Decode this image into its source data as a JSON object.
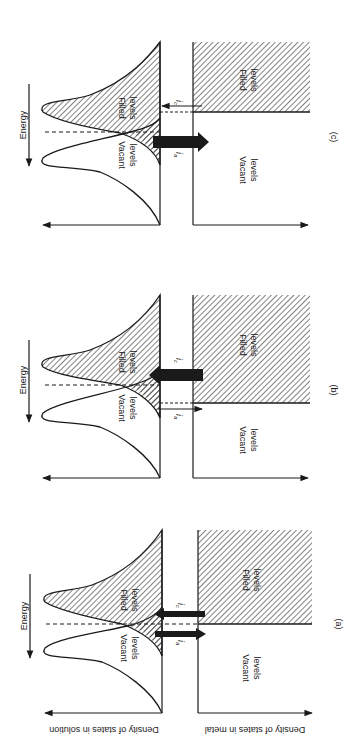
{
  "figure": {
    "axes": {
      "energy": "Energy",
      "solution": "Density of states in solution",
      "metal": "Density of states in metal"
    },
    "panels": [
      {
        "id": "c",
        "caption": "(c)",
        "solution_vacant": [
          "Vacant",
          "levels"
        ],
        "solution_filled": [
          "Filled",
          "levels"
        ],
        "metal_vacant": [
          "Vacant",
          "levels"
        ],
        "metal_filled": [
          "Filled",
          "levels"
        ],
        "current_a": "i",
        "current_a_sub": "a",
        "current_c": "i",
        "current_c_sub": "c",
        "dominant": "anodic"
      },
      {
        "id": "b",
        "caption": "(b)",
        "solution_vacant": [
          "Vacant",
          "levels"
        ],
        "solution_filled": [
          "Filled",
          "levels"
        ],
        "metal_vacant": [
          "Vacant",
          "levels"
        ],
        "metal_filled": [
          "Filled",
          "levels"
        ],
        "current_a": "i",
        "current_a_sub": "a",
        "current_c": "i",
        "current_c_sub": "c",
        "dominant": "cathodic"
      },
      {
        "id": "a",
        "caption": "(a)",
        "solution_vacant": [
          "Vacant",
          "levels"
        ],
        "solution_filled": [
          "Filled",
          "levels"
        ],
        "metal_vacant": [
          "Vacant",
          "levels"
        ],
        "metal_filled": [
          "Filled",
          "levels"
        ],
        "current_a": "i",
        "current_a_sub": "a",
        "current_c": "i",
        "current_c_sub": "c",
        "dominant": "equilibrium"
      }
    ],
    "colors": {
      "ink": "#1a1a1a",
      "background": "#ffffff"
    }
  }
}
